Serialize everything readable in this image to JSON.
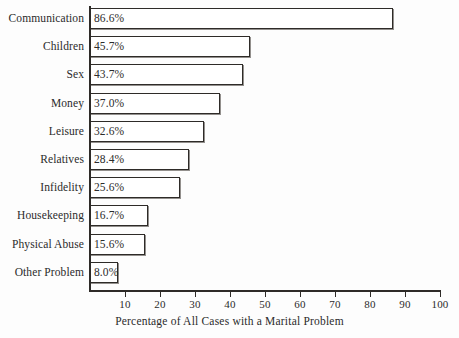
{
  "chart_data": {
    "type": "bar",
    "orientation": "horizontal",
    "title": "",
    "xlabel": "Percentage of All Cases with a Marital Problem",
    "ylabel": "",
    "xlim": [
      0,
      100
    ],
    "xticks": [
      10,
      20,
      30,
      40,
      50,
      60,
      70,
      80,
      90,
      100
    ],
    "xtick_labels": [
      "10",
      "20",
      "30",
      "40",
      "50",
      "60",
      "70",
      "80",
      "90",
      "100"
    ],
    "grid": false,
    "legend": null,
    "categories": [
      "Communication",
      "Children",
      "Sex",
      "Money",
      "Leisure",
      "Relatives",
      "Infidelity",
      "Housekeeping",
      "Physical Abuse",
      "Other Problem"
    ],
    "values": [
      86.6,
      45.7,
      43.7,
      37.0,
      32.6,
      28.4,
      25.6,
      16.7,
      15.6,
      8.0
    ],
    "value_labels": [
      "86.6%",
      "45.7%",
      "43.7%",
      "37.0%",
      "32.6%",
      "28.4%",
      "25.6%",
      "16.7%",
      "15.6%",
      "8.0%"
    ],
    "bar_fill_color": "#ffffff",
    "bar_edge_color": "#2e2b28",
    "background_color": "#fdfdfd"
  }
}
